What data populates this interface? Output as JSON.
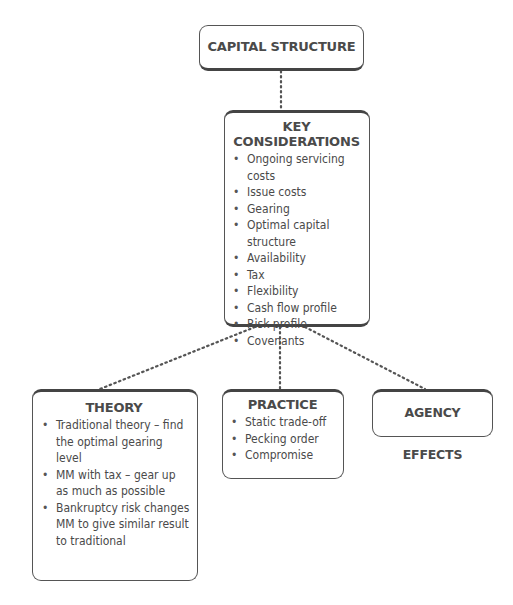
{
  "diagram": {
    "root": {
      "title": "CAPITAL STRUCTURE"
    },
    "key_considerations": {
      "title": "KEY CONSIDERATIONS",
      "items": [
        "Ongoing servicing costs",
        "Issue costs",
        "Gearing",
        "Optimal capital structure",
        "Availability",
        "Tax",
        "Flexibility",
        "Cash flow profile",
        "Risk profile",
        "Covenants"
      ]
    },
    "theory": {
      "title": "THEORY",
      "items": [
        "Traditional theory – find the optimal gearing level",
        "MM with tax – gear up as much as possible",
        "Bankruptcy risk changes MM to give similar result to traditional"
      ]
    },
    "practice": {
      "title": "PRACTICE",
      "items": [
        "Static trade-off",
        "Pecking order",
        "Compromise"
      ]
    },
    "agency": {
      "title": "AGENCY EFFECTS"
    }
  }
}
